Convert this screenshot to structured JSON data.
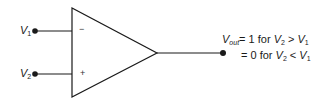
{
  "diagram": {
    "type": "comparator-op-amp",
    "inputs": [
      {
        "var": "V",
        "sub": "1",
        "terminal": "−"
      },
      {
        "var": "V",
        "sub": "2",
        "terminal": "+"
      }
    ],
    "output": {
      "var": "V",
      "sub": "out",
      "line1": {
        "eq": "= 1 for ",
        "a_var": "V",
        "a_sub": "2",
        "op": " > ",
        "b_var": "V",
        "b_sub": "1"
      },
      "line2": {
        "eq": "= 0 for ",
        "a_var": "V",
        "a_sub": "2",
        "op": " < ",
        "b_var": "V",
        "b_sub": "1"
      }
    },
    "colors": {
      "stroke": "#1a1a1a",
      "background": "#ffffff"
    }
  }
}
